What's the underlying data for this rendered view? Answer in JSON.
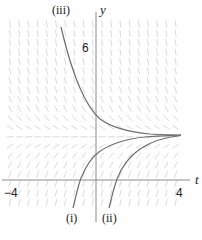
{
  "figure": {
    "type": "slope-field",
    "axes": {
      "x_label": "t",
      "y_label": "y",
      "x_tick_labels": [
        "−4",
        "4"
      ],
      "y_tick_labels": [
        "6"
      ]
    },
    "curve_labels": [
      "(i)",
      "(ii)",
      "(iii)"
    ],
    "colors": {
      "axis": "#888888",
      "slope_marks": "#d6d6d6",
      "curves": "#707070",
      "text": "#222222"
    },
    "equilibrium_y": 2
  },
  "chart_data": {
    "type": "line",
    "title": "",
    "xlabel": "t",
    "ylabel": "y",
    "xlim": [
      -4,
      4
    ],
    "ylim": [
      -2,
      8
    ],
    "x_ticks": [
      -4,
      4
    ],
    "y_ticks": [
      6
    ],
    "grid": false,
    "background": "slope field of dy/dt with stable equilibrium near y = 2",
    "series": [
      {
        "name": "(i)",
        "points": [
          [
            -1.1,
            -1.0
          ],
          [
            -0.8,
            0.0
          ],
          [
            0.0,
            1.05
          ],
          [
            1.15,
            1.75
          ],
          [
            2.6,
            2.0
          ],
          [
            4.0,
            2.05
          ]
        ]
      },
      {
        "name": "(ii)",
        "points": [
          [
            0.6,
            -1.0
          ],
          [
            0.95,
            0.0
          ],
          [
            1.6,
            0.9
          ],
          [
            2.6,
            1.6
          ],
          [
            4.0,
            2.0
          ]
        ]
      },
      {
        "name": "(iii)",
        "points": [
          [
            -1.7,
            6.9
          ],
          [
            -1.25,
            5.45
          ],
          [
            -0.8,
            4.1
          ],
          [
            -0.3,
            3.3
          ],
          [
            0.2,
            2.7
          ],
          [
            1.15,
            2.3
          ],
          [
            2.6,
            2.1
          ],
          [
            4.0,
            2.05
          ]
        ]
      }
    ]
  }
}
